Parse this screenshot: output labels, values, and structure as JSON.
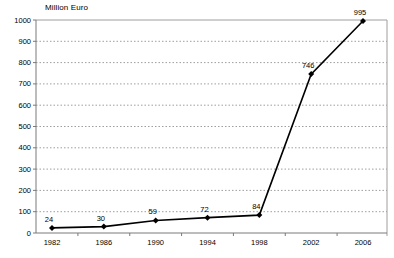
{
  "chart": {
    "unit_label": "Million Euro"
  },
  "chart_data": {
    "type": "line",
    "title": "",
    "ylabel": "Million Euro",
    "xlabel": "",
    "categories": [
      "1982",
      "1986",
      "1990",
      "1994",
      "1998",
      "2002",
      "2006"
    ],
    "series": [
      {
        "name": "Million Euro",
        "values": [
          24,
          30,
          59,
          72,
          84,
          746,
          995
        ]
      }
    ],
    "data_labels": [
      "24",
      "30",
      "59",
      "72",
      "84",
      "746",
      "995"
    ],
    "ylim": [
      0,
      1000
    ],
    "ytick_step": 100,
    "yticks": [
      0,
      100,
      200,
      300,
      400,
      500,
      600,
      700,
      800,
      900,
      1000
    ],
    "grid": "horizontal-dashed",
    "legend_position": "none",
    "marker": "diamond",
    "colors": {
      "line": "#000000",
      "marker": "#000000",
      "gridline": "#9e9e9e",
      "axis": "#7a7a7a",
      "plot_border": "#9e9e9e",
      "text": "#000000",
      "background": "#ffffff"
    }
  }
}
